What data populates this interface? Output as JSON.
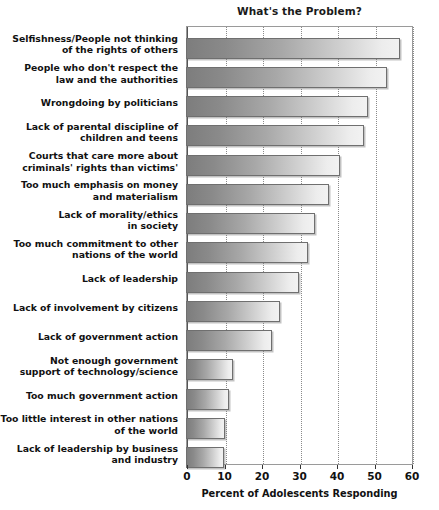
{
  "chart_data": {
    "type": "bar",
    "orientation": "horizontal",
    "title": "What's the Problem?",
    "xlabel": "Percent of Adolescents Responding",
    "ylabel": "",
    "xlim": [
      0,
      60
    ],
    "xticks": [
      0,
      10,
      20,
      30,
      40,
      50,
      60
    ],
    "xtick_labels": [
      "0",
      "10",
      "20",
      "30",
      "40",
      "50",
      "60"
    ],
    "grid": "vertical dotted gridlines at each x tick",
    "legend": "none",
    "categories": [
      "Selfishness/People not thinking of the rights of others",
      "People who don't respect the law and the authorities",
      "Wrongdoing by politicians",
      "Lack of parental discipline of children and teens",
      "Courts that care more about criminals' rights than victims'",
      "Too much emphasis on money and materialism",
      "Lack of morality/ethics in society",
      "Too much commitment to other nations of the world",
      "Lack of leadership",
      "Lack of involvement by citizens",
      "Lack of government action",
      "Not enough government support of technology/science",
      "Too much government action",
      "Too little interest in other nations of the world",
      "Lack of leadership by business and industry"
    ],
    "category_lines": [
      [
        "Selfishness/People not thinking",
        "of the rights of others"
      ],
      [
        "People who don't respect the",
        "law and the authorities"
      ],
      [
        "Wrongdoing by politicians"
      ],
      [
        "Lack of parental discipline of",
        "children and teens"
      ],
      [
        "Courts that care more about",
        "criminals' rights than victims'"
      ],
      [
        "Too much emphasis on money",
        "and materialism"
      ],
      [
        "Lack of morality/ethics",
        "in society"
      ],
      [
        "Too much commitment to other",
        "nations of the world"
      ],
      [
        "Lack of leadership"
      ],
      [
        "Lack of involvement by citizens"
      ],
      [
        "Lack of government action"
      ],
      [
        "Not enough government",
        "support of technology/science"
      ],
      [
        "Too much government action"
      ],
      [
        "Too little interest in other nations",
        "of the world"
      ],
      [
        "Lack of leadership by business",
        "and industry"
      ]
    ],
    "values": [
      57,
      53.5,
      48.5,
      47.5,
      41,
      38,
      34.5,
      32.5,
      30,
      25,
      23,
      12.5,
      11.5,
      10.5,
      10
    ],
    "bar_gradient": {
      "from": "#7d7d7d",
      "to": "#f2f2f2",
      "border": "#6f6f6f"
    }
  }
}
